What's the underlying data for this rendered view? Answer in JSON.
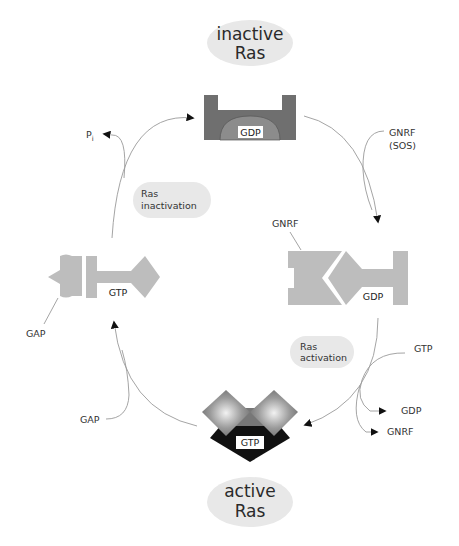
{
  "states": {
    "inactive": {
      "line1": "inactive",
      "line2": "Ras"
    },
    "active": {
      "line1": "active",
      "line2": "Ras"
    }
  },
  "processes": {
    "inactivation": {
      "line1": "Ras",
      "line2": "inactivation"
    },
    "activation": {
      "line1": "Ras",
      "line2": "activation"
    }
  },
  "nucleotides": {
    "top": "GDP",
    "right": "GDP",
    "bottom": "GTP",
    "left": "GTP"
  },
  "factors": {
    "gnrf_sos_line1": "GNRF",
    "gnrf_sos_line2": "(SOS)",
    "gnrf_bound": "GNRF",
    "gtp_in": "GTP",
    "gdp_out": "GDP",
    "gnrf_out": "GNRF",
    "gap_bottom": "GAP",
    "gap_bound": "GAP",
    "pi_main": "P",
    "pi_sub": "i"
  },
  "colors": {
    "ellipse": "#e8e8e8",
    "inactive_ras": "#6f6f6f",
    "inactive_pocket": "#8c8c8c",
    "light_protein": "#bdbdbd",
    "active_core": "#111111",
    "arrow": "#9a9a9a"
  }
}
